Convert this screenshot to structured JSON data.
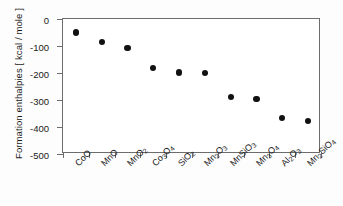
{
  "chart_data": {
    "type": "scatter",
    "title": "",
    "xlabel": "",
    "ylabel": "Formation enthalpies [ kcal / mole ]",
    "categories": [
      "CoO",
      "MnO",
      "MnO2",
      "Co3O4",
      "SiO2",
      "Mn2O3",
      "MnSiO3",
      "Mn3O4",
      "Al2O3",
      "Mn2SiO4"
    ],
    "categories_display": [
      "CoO",
      "MnO",
      "MnO₂",
      "Co₃O₄",
      "SiO₂",
      "Mn₂O₃",
      "MnSiO₃",
      "Mn₃O₄",
      "Al₂O₃",
      "Mn₂SiO₄"
    ],
    "values": [
      -50,
      -85,
      -108,
      -180,
      -198,
      -201,
      -288,
      -297,
      -368,
      -378
    ],
    "ylim": [
      -500,
      0
    ],
    "yticks": [
      0,
      -100,
      -200,
      -300,
      -400,
      -500
    ],
    "ytick_labels": [
      "0",
      "-100",
      "-200",
      "-300",
      "-400",
      "-500"
    ],
    "grid": false,
    "legend": null,
    "marker": {
      "shape": "circle",
      "color": "#111111",
      "filled": true
    },
    "axis_color": "#6d6d6d",
    "background": "#ffffff"
  }
}
